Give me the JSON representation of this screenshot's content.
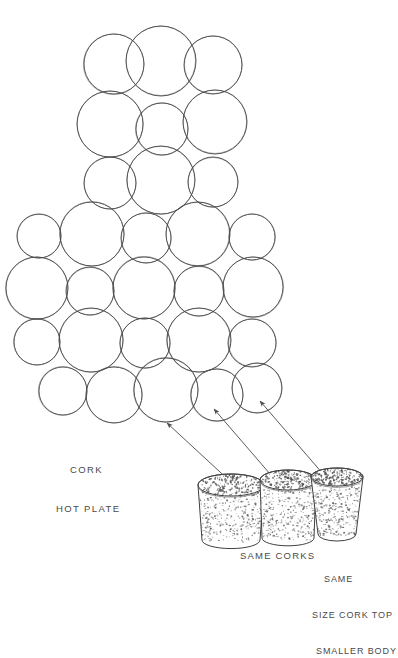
{
  "drawing": {
    "title_visible": false,
    "background_color": "#ffffff",
    "ink_color": "#4a4a4a",
    "texture_color": "#555555",
    "type": "hand-drawn-technical-sketch",
    "subject": "cork hot plate made of wine corks"
  },
  "labels": {
    "hot_plate_line1": "CORK",
    "hot_plate_line2": "HOT PLATE",
    "same_corks": "SAME CORKS",
    "same_size_line1": "SAME",
    "same_size_line2": "SIZE CORK TOP",
    "same_size_line3": "SMALLER BODY"
  },
  "cork_circles": [
    {
      "cx": 114,
      "cy": 64,
      "r": 30
    },
    {
      "cx": 161,
      "cy": 61,
      "r": 35
    },
    {
      "cx": 213,
      "cy": 65,
      "r": 29
    },
    {
      "cx": 110,
      "cy": 124,
      "r": 33
    },
    {
      "cx": 162,
      "cy": 129,
      "r": 26
    },
    {
      "cx": 215,
      "cy": 122,
      "r": 32
    },
    {
      "cx": 110,
      "cy": 183,
      "r": 26
    },
    {
      "cx": 161,
      "cy": 180,
      "r": 34
    },
    {
      "cx": 213,
      "cy": 182,
      "r": 25
    },
    {
      "cx": 39,
      "cy": 236,
      "r": 22
    },
    {
      "cx": 92,
      "cy": 234,
      "r": 32
    },
    {
      "cx": 146,
      "cy": 238,
      "r": 25
    },
    {
      "cx": 198,
      "cy": 234,
      "r": 32
    },
    {
      "cx": 252,
      "cy": 237,
      "r": 23
    },
    {
      "cx": 37,
      "cy": 288,
      "r": 31
    },
    {
      "cx": 90,
      "cy": 291,
      "r": 24
    },
    {
      "cx": 144,
      "cy": 288,
      "r": 31
    },
    {
      "cx": 199,
      "cy": 291,
      "r": 25
    },
    {
      "cx": 253,
      "cy": 287,
      "r": 30
    },
    {
      "cx": 37,
      "cy": 342,
      "r": 23
    },
    {
      "cx": 91,
      "cy": 340,
      "r": 32
    },
    {
      "cx": 145,
      "cy": 343,
      "r": 25
    },
    {
      "cx": 199,
      "cy": 340,
      "r": 32
    },
    {
      "cx": 252,
      "cy": 343,
      "r": 24
    },
    {
      "cx": 63,
      "cy": 391,
      "r": 24
    },
    {
      "cx": 114,
      "cy": 395,
      "r": 28
    },
    {
      "cx": 166,
      "cy": 390,
      "r": 32
    },
    {
      "cx": 217,
      "cy": 395,
      "r": 26
    },
    {
      "cx": 257,
      "cy": 388,
      "r": 25
    }
  ],
  "arrows": [
    {
      "from_x": 246,
      "from_y": 496,
      "to_x": 167,
      "to_y": 423
    },
    {
      "from_x": 283,
      "from_y": 489,
      "to_x": 214,
      "to_y": 409
    },
    {
      "from_x": 330,
      "from_y": 482,
      "to_x": 260,
      "to_y": 401
    }
  ],
  "corks": [
    {
      "name": "cork-left",
      "top_cx": 231,
      "top_cy": 485,
      "top_rx": 33,
      "top_ry": 11,
      "bottom_cy": 540,
      "bottom_rx": 29
    },
    {
      "name": "cork-middle",
      "top_cx": 288,
      "top_cy": 480,
      "top_rx": 28,
      "top_ry": 10,
      "bottom_cy": 538,
      "bottom_rx": 26
    },
    {
      "name": "cork-right",
      "top_cx": 337,
      "top_cy": 477,
      "top_rx": 26,
      "top_ry": 9,
      "bottom_cy": 534,
      "bottom_rx": 19
    }
  ]
}
